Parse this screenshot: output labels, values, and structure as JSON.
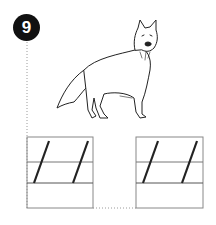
{
  "exercise": {
    "number": "9",
    "image_subject": "fox",
    "icons": {
      "animal": "fox-drawing-icon"
    },
    "writing_boxes": [
      {
        "id": "left",
        "guide_strokes": 2
      },
      {
        "id": "right",
        "guide_strokes": 2
      }
    ],
    "colors": {
      "badge": "#111111",
      "lines": "#888888",
      "strokes": "#222222",
      "dotted": "#999999"
    }
  }
}
